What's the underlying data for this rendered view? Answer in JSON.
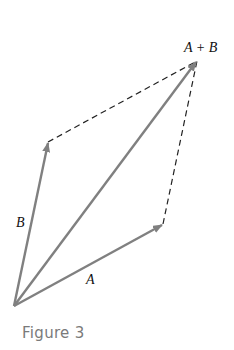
{
  "figure": {
    "caption": "Figure 3",
    "labels": {
      "a": "A",
      "b": "B",
      "sum": "A + B"
    },
    "colors": {
      "vector": "#808080",
      "dashed": "#222222",
      "caption": "#7a7a7a"
    },
    "points": {
      "origin": [
        14,
        306
      ],
      "a_tip": [
        163,
        224
      ],
      "b_tip": [
        48,
        142
      ],
      "sum_tip": [
        197,
        61
      ]
    }
  }
}
